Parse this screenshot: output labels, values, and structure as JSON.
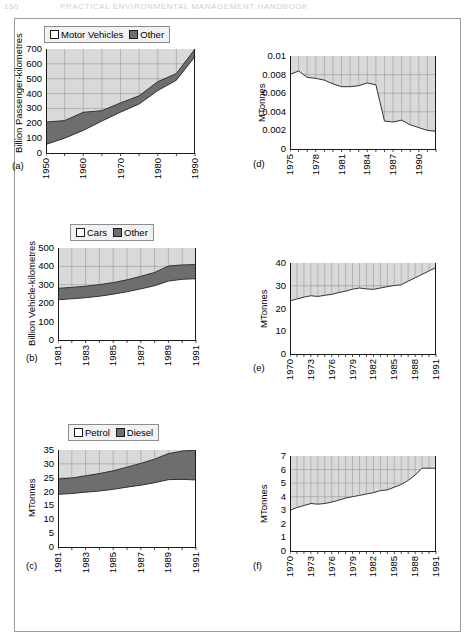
{
  "page_header": {
    "page_number": "160",
    "running_title": "PRACTICAL ENVIRONMENTAL MANAGEMENT HANDBOOK"
  },
  "colors": {
    "series_light": "#d9d9d9",
    "series_dark": "#6e6e6e",
    "plot_line": "#333333",
    "axis": "#1a1a1a",
    "grid": "#8c8c8c",
    "frame": "#9b9b9b",
    "legend_bg": "#f2f2f2"
  },
  "panels": [
    {
      "id": "a",
      "label": "(a)",
      "legend": [
        {
          "name": "Motor Vehicles",
          "swatch": "light"
        },
        {
          "name": "Other",
          "swatch": "dark"
        }
      ],
      "chart_data": {
        "type": "area",
        "title": "",
        "xlabel": "",
        "ylabel": "Billion Passenger-kilometres",
        "ylim": [
          0,
          700
        ],
        "yticks": [
          0,
          100,
          200,
          300,
          400,
          500,
          600,
          700
        ],
        "xlim": [
          1950,
          1990
        ],
        "xticks": [
          1950,
          1960,
          1970,
          1980,
          1990
        ],
        "xtick_labels": [
          "1950",
          "1960",
          "1970",
          "1980",
          "1990"
        ],
        "grid": true,
        "legend_position": "above-left",
        "stacked": true,
        "x": [
          1950,
          1955,
          1960,
          1965,
          1970,
          1975,
          1980,
          1985,
          1990
        ],
        "series": [
          {
            "name": "Motor Vehicles",
            "values": [
              58,
              100,
              152,
              215,
              275,
              330,
              420,
              490,
              650
            ]
          },
          {
            "name": "Other",
            "values": [
              150,
              118,
              122,
              70,
              62,
              55,
              60,
              45,
              50
            ]
          }
        ],
        "totals": [
          208,
          218,
          274,
          285,
          337,
          385,
          480,
          535,
          700
        ]
      }
    },
    {
      "id": "d",
      "label": "(d)",
      "legend": null,
      "chart_data": {
        "type": "area",
        "title": "",
        "xlabel": "",
        "ylabel": "MTonnes",
        "ylim": [
          0,
          0.01
        ],
        "yticks": [
          0,
          0.002,
          0.004,
          0.006,
          0.008,
          0.01
        ],
        "ytick_labels": [
          "0",
          "0.002",
          "0.004",
          "0.006",
          "0.008",
          "0.01"
        ],
        "xlim": [
          1975,
          1992
        ],
        "xticks": [
          1975,
          1978,
          1981,
          1984,
          1987,
          1990
        ],
        "xtick_labels": [
          "1975",
          "1978",
          "1981",
          "1984",
          "1987",
          "1990"
        ],
        "grid": true,
        "legend_position": "none",
        "x": [
          1975,
          1976,
          1977,
          1978,
          1979,
          1980,
          1981,
          1982,
          1983,
          1984,
          1985,
          1986,
          1987,
          1988,
          1989,
          1990,
          1991,
          1992
        ],
        "values": [
          0.008,
          0.0084,
          0.0077,
          0.0076,
          0.0074,
          0.007,
          0.0067,
          0.0067,
          0.0068,
          0.0071,
          0.0069,
          0.003,
          0.0029,
          0.0031,
          0.0026,
          0.0023,
          0.002,
          0.0019
        ]
      }
    },
    {
      "id": "b",
      "label": "(b)",
      "legend": [
        {
          "name": "Cars",
          "swatch": "light"
        },
        {
          "name": "Other",
          "swatch": "dark"
        }
      ],
      "chart_data": {
        "type": "area",
        "title": "",
        "xlabel": "",
        "ylabel": "Billion Vehicle-kilometres",
        "ylim": [
          0,
          500
        ],
        "yticks": [
          0,
          100,
          200,
          300,
          400,
          500
        ],
        "xlim": [
          1981,
          1991
        ],
        "xticks": [
          1981,
          1983,
          1985,
          1987,
          1989,
          1991
        ],
        "xtick_labels": [
          "1981",
          "1983",
          "1985",
          "1987",
          "1989",
          "1991"
        ],
        "grid": true,
        "legend_position": "above-center",
        "stacked": true,
        "x": [
          1981,
          1982,
          1983,
          1984,
          1985,
          1986,
          1987,
          1988,
          1989,
          1990,
          1991
        ],
        "series": [
          {
            "name": "Cars",
            "values": [
              219,
              224,
              230,
              238,
              249,
              262,
              278,
              295,
              320,
              330,
              333
            ]
          },
          {
            "name": "Other",
            "values": [
              62,
              62,
              62,
              63,
              63,
              65,
              68,
              72,
              82,
              78,
              77
            ]
          }
        ],
        "totals": [
          281,
          286,
          292,
          301,
          312,
          327,
          346,
          367,
          402,
          408,
          410
        ]
      }
    },
    {
      "id": "e",
      "label": "(e)",
      "legend": null,
      "chart_data": {
        "type": "area",
        "title": "",
        "xlabel": "",
        "ylabel": "MTonnes",
        "ylim": [
          0,
          40
        ],
        "yticks": [
          0,
          10,
          20,
          30,
          40
        ],
        "xlim": [
          1970,
          1991
        ],
        "xticks": [
          1970,
          1973,
          1976,
          1979,
          1982,
          1985,
          1988,
          1991
        ],
        "xtick_labels": [
          "1970",
          "1973",
          "1976",
          "1979",
          "1982",
          "1985",
          "1988",
          "1991"
        ],
        "grid": true,
        "legend_position": "none",
        "x": [
          1970,
          1971,
          1972,
          1973,
          1974,
          1975,
          1976,
          1977,
          1978,
          1979,
          1980,
          1981,
          1982,
          1983,
          1984,
          1985,
          1986,
          1987,
          1988,
          1989,
          1990,
          1991
        ],
        "values": [
          23.3,
          24.2,
          25.0,
          25.6,
          25.3,
          25.8,
          26.2,
          27.0,
          27.6,
          28.5,
          29.0,
          28.6,
          28.4,
          29.0,
          29.6,
          30.1,
          30.4,
          32.0,
          33.5,
          35.0,
          36.5,
          38.0
        ]
      }
    },
    {
      "id": "c",
      "label": "(c)",
      "legend": [
        {
          "name": "Petrol",
          "swatch": "light"
        },
        {
          "name": "Diesel",
          "swatch": "dark"
        }
      ],
      "chart_data": {
        "type": "area",
        "title": "",
        "xlabel": "",
        "ylabel": "MTonnes",
        "ylim": [
          0,
          35
        ],
        "yticks": [
          0,
          5,
          10,
          15,
          20,
          25,
          30,
          35
        ],
        "xlim": [
          1981,
          1991
        ],
        "xticks": [
          1981,
          1983,
          1985,
          1987,
          1989,
          1991
        ],
        "xtick_labels": [
          "1981",
          "1983",
          "1985",
          "1987",
          "1989",
          "1991"
        ],
        "grid": true,
        "legend_position": "above-center",
        "stacked": true,
        "x": [
          1981,
          1982,
          1983,
          1984,
          1985,
          1986,
          1987,
          1988,
          1989,
          1990,
          1991
        ],
        "series": [
          {
            "name": "Petrol",
            "values": [
              19.0,
              19.3,
              19.8,
              20.2,
              20.8,
              21.6,
              22.3,
              23.2,
              24.3,
              24.4,
              24.2
            ]
          },
          {
            "name": "Diesel",
            "values": [
              5.5,
              5.6,
              5.9,
              6.3,
              6.7,
              7.2,
              7.9,
              8.5,
              9.4,
              10.2,
              10.8
            ]
          }
        ],
        "totals": [
          24.5,
          24.9,
          25.7,
          26.5,
          27.5,
          28.8,
          30.2,
          31.7,
          33.7,
          34.6,
          35.0
        ]
      }
    },
    {
      "id": "f",
      "label": "(f)",
      "legend": null,
      "chart_data": {
        "type": "area",
        "title": "",
        "xlabel": "",
        "ylabel": "MTonnes",
        "ylim": [
          0,
          7
        ],
        "yticks": [
          0,
          1,
          2,
          3,
          4,
          5,
          6,
          7
        ],
        "xlim": [
          1970,
          1991
        ],
        "xticks": [
          1970,
          1973,
          1976,
          1979,
          1982,
          1985,
          1988,
          1991
        ],
        "xtick_labels": [
          "1970",
          "1973",
          "1976",
          "1979",
          "1982",
          "1985",
          "1988",
          "1991"
        ],
        "grid": true,
        "legend_position": "none",
        "x": [
          1970,
          1971,
          1972,
          1973,
          1974,
          1975,
          1976,
          1977,
          1978,
          1979,
          1980,
          1981,
          1982,
          1983,
          1984,
          1985,
          1986,
          1987,
          1988,
          1989,
          1990,
          1991
        ],
        "values": [
          3.0,
          3.2,
          3.35,
          3.5,
          3.45,
          3.5,
          3.6,
          3.75,
          3.9,
          4.0,
          4.1,
          4.2,
          4.3,
          4.45,
          4.5,
          4.7,
          4.9,
          5.2,
          5.6,
          6.1,
          6.1,
          6.1
        ]
      }
    }
  ]
}
